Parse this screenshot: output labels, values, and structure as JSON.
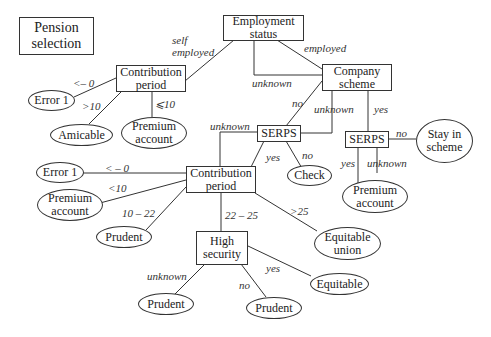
{
  "title": "Pension\nselection",
  "nodes": {
    "employment_status": "Employment status",
    "contribution_period_1": "Contribution period",
    "company_scheme": "Company scheme",
    "error1_a": "Error 1",
    "amicable": "Amicable",
    "premium_account_1": "Premium account",
    "serps_1": "SERPS",
    "serps_2": "SERPS",
    "check": "Check",
    "stay_in_scheme": "Stay in scheme",
    "premium_account_2": "Premium account",
    "contribution_period_2": "Contribution period",
    "error1_b": "Error 1",
    "premium_account_3": "Premium account",
    "prudent_1": "Prudent",
    "equitable_union": "Equitable union",
    "high_security": "High security",
    "prudent_2": "Prudent",
    "prudent_3": "Prudent",
    "equitable": "Equitable"
  },
  "edge_labels": {
    "self_employed": "self\nemployed",
    "employed": "employed",
    "unknown_emp": "unknown",
    "lt0_a": "<– 0",
    "gt10": ">10",
    "le10": "⩽10",
    "no_cs": "no",
    "unknown_cs": "unknown",
    "yes_cs": "yes",
    "unknown_serps1": "unknown",
    "yes_serps1": "yes",
    "no_serps1": "no",
    "no_serps2": "no",
    "yes_serps2": "yes",
    "unknown_serps2": "unknown",
    "lt0_b": "< – 0",
    "lt10": "<10",
    "r10_22": "10 – 22",
    "r22_25": "22 – 25",
    "gt25": ">25",
    "unknown_hs": "unknown",
    "no_hs": "no",
    "yes_hs": "yes"
  }
}
